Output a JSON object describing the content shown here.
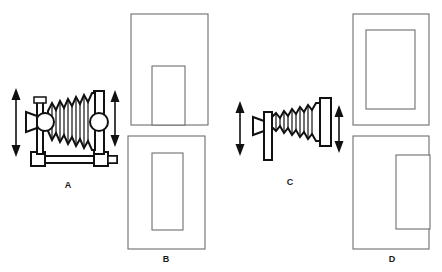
{
  "diagram": {
    "background_color": "#ffffff",
    "ink_color": "#111111",
    "panel_stroke_color": "#6e6e6e"
  },
  "figures": [
    {
      "id": "A",
      "label": "A",
      "kind": "bellows-camera-side-view",
      "description": "Side elevation of a bellows camera with lens at left, two round standards, accordion bellows and base rail with feet",
      "arrows": [
        "vertical-double-arrow-left",
        "vertical-double-arrow-right"
      ]
    },
    {
      "id": "B",
      "label": "B",
      "kind": "panel-with-inner-rectangle",
      "description": "Rectangular panel containing an upright inner rectangle centred with margin on all sides"
    },
    {
      "id": "C",
      "label": "C",
      "kind": "bellows-camera-front-view",
      "description": "Tapered bellows seen end on, lens at left and flat rectangular back standard at right",
      "arrows": [
        "vertical-double-arrow-left",
        "vertical-double-arrow-right"
      ]
    },
    {
      "id": "D",
      "label": "D",
      "kind": "panel-with-inner-rectangle",
      "description": "Rectangular panel containing an inner rectangle pushed to the right edge"
    }
  ],
  "panels": {
    "top_left": {
      "name": "panel-top-left",
      "label": "",
      "inner_rect_position": "bottom-centre-touching-bottom-edge"
    },
    "bottom_left": {
      "name": "panel-b",
      "label": "B",
      "inner_rect_position": "centred"
    },
    "top_right": {
      "name": "panel-top-right",
      "label": "",
      "inner_rect_position": "centred"
    },
    "bottom_right": {
      "name": "panel-d",
      "label": "D",
      "inner_rect_position": "right-edge-overhanging"
    }
  },
  "labels": {
    "a": "A",
    "b": "B",
    "c": "C",
    "d": "D"
  }
}
